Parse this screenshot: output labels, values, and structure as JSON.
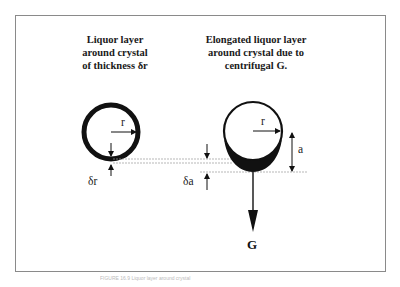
{
  "diagram": {
    "left_panel": {
      "title_lines": [
        "Liquor layer",
        "around crystal",
        "of thickness δr"
      ],
      "radius_label": "r",
      "thickness_label": "δr"
    },
    "right_panel": {
      "title_lines": [
        "Elongated liquor layer",
        "around crystal due to",
        "centrifugal G."
      ],
      "radius_label": "r",
      "height_label": "a",
      "thickness_label": "δa",
      "force_label": "G"
    },
    "colors": {
      "ink": "#111111",
      "frame": "#8a8a8a",
      "guide_lines": "#9a9a9a"
    },
    "caption": "FIGURE 16.9  Liquor layer around crystal"
  }
}
